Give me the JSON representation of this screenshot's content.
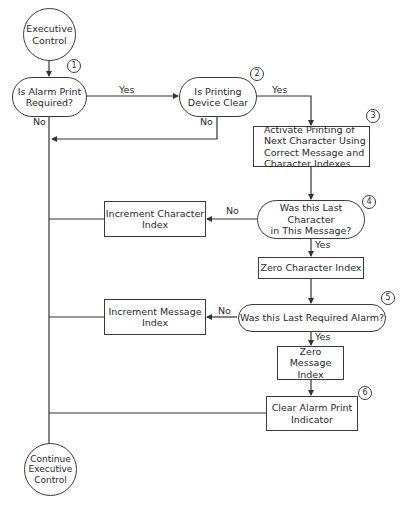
{
  "diagram": {
    "type": "flowchart",
    "nodes": {
      "start": {
        "label": "Executive\nControl",
        "shape": "circle"
      },
      "alarm_required": {
        "label": "Is Alarm Print\nRequired?",
        "shape": "decision",
        "step": "1"
      },
      "device_clear": {
        "label": "Is Printing\nDevice Clear",
        "shape": "decision",
        "step": "2"
      },
      "activate_printing": {
        "label": "Activate Printing of\nNext Character Using\nCorrect Message and\nCharacter Indexes",
        "shape": "process",
        "step": "3"
      },
      "last_character": {
        "label": "Was this Last Character\nin This Message?",
        "shape": "decision",
        "step": "4"
      },
      "increment_character": {
        "label": "Increment Character\nIndex",
        "shape": "process"
      },
      "zero_character": {
        "label": "Zero Character Index",
        "shape": "process"
      },
      "last_alarm": {
        "label": "Was this Last Required Alarm?",
        "shape": "decision",
        "step": "5"
      },
      "increment_message": {
        "label": "Increment Message\nIndex",
        "shape": "process"
      },
      "zero_message": {
        "label": "Zero Message\nIndex",
        "shape": "process"
      },
      "clear_indicator": {
        "label": "Clear Alarm Print\nIndicator",
        "shape": "process",
        "step": "6"
      },
      "end": {
        "label": "Continue\nExecutive\nControl",
        "shape": "circle"
      }
    },
    "edge_labels": {
      "alarm_yes": "Yes",
      "alarm_no": "No",
      "device_yes": "Yes",
      "device_no": "No",
      "char_no": "No",
      "char_yes": "Yes",
      "alarm_last_no": "No",
      "alarm_last_yes": "Yes"
    },
    "edges": [
      {
        "from": "start",
        "to": "alarm_required"
      },
      {
        "from": "alarm_required",
        "to": "device_clear",
        "label": "Yes"
      },
      {
        "from": "alarm_required",
        "to": "end",
        "label": "No"
      },
      {
        "from": "device_clear",
        "to": "activate_printing",
        "label": "Yes"
      },
      {
        "from": "device_clear",
        "to": "end",
        "label": "No"
      },
      {
        "from": "activate_printing",
        "to": "last_character"
      },
      {
        "from": "last_character",
        "to": "increment_character",
        "label": "No"
      },
      {
        "from": "increment_character",
        "to": "end"
      },
      {
        "from": "last_character",
        "to": "zero_character",
        "label": "Yes"
      },
      {
        "from": "zero_character",
        "to": "last_alarm"
      },
      {
        "from": "last_alarm",
        "to": "increment_message",
        "label": "No"
      },
      {
        "from": "increment_message",
        "to": "end"
      },
      {
        "from": "last_alarm",
        "to": "zero_message",
        "label": "Yes"
      },
      {
        "from": "zero_message",
        "to": "clear_indicator"
      },
      {
        "from": "clear_indicator",
        "to": "end"
      }
    ]
  }
}
